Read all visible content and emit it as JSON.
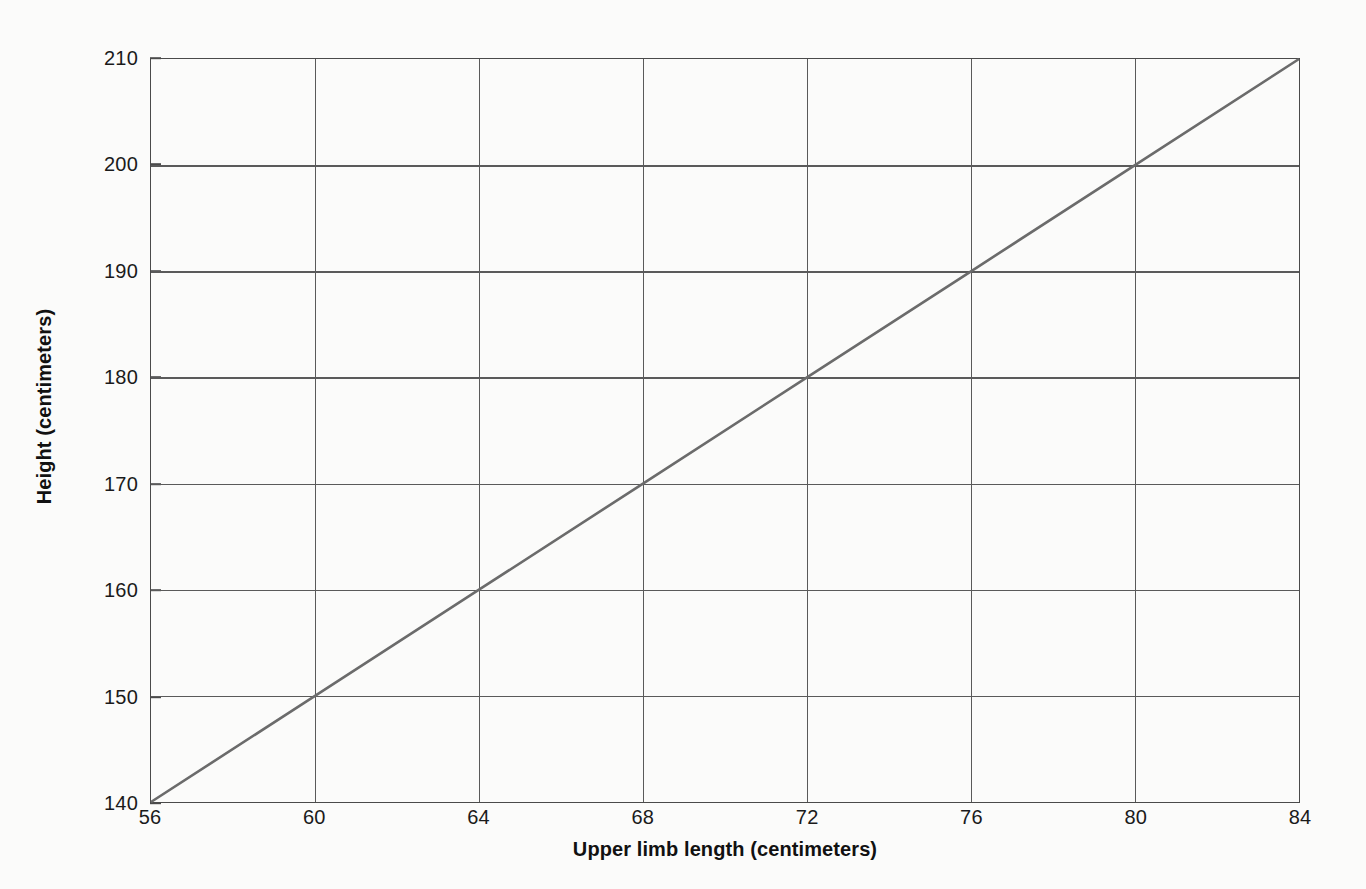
{
  "chart_data": {
    "type": "line",
    "title": "",
    "subtitle": "",
    "xlabel": "Upper limb length (centimeters)",
    "ylabel": "Height (centimeters)",
    "xlim": [
      56,
      84
    ],
    "ylim": [
      140,
      210
    ],
    "xticks": [
      56,
      60,
      64,
      68,
      72,
      76,
      80,
      84
    ],
    "yticks": [
      140,
      150,
      160,
      170,
      180,
      190,
      200,
      210
    ],
    "xtick_labels": [
      "56",
      "60",
      "64",
      "68",
      "72",
      "76",
      "80",
      "84"
    ],
    "ytick_labels": [
      "140",
      "150",
      "160",
      "170",
      "180",
      "190",
      "200",
      "210"
    ],
    "grid": true,
    "legend": "none",
    "annotations": [],
    "series": [
      {
        "name": "Height vs upper limb length",
        "color": "#6b6b6b",
        "x": [
          56,
          60,
          64,
          68,
          72,
          76,
          80,
          84
        ],
        "values": [
          140,
          150,
          160,
          170,
          180,
          190,
          200,
          210
        ]
      }
    ]
  },
  "axes": {
    "x_title": "Upper limb length (centimeters)",
    "y_title": "Height (centimeters)"
  },
  "colors": {
    "background": "#fbfbfa",
    "grid": "#5a5a5a",
    "frame": "#4a4a4a",
    "line": "#6b6b6b",
    "text": "#1a1a1a"
  }
}
